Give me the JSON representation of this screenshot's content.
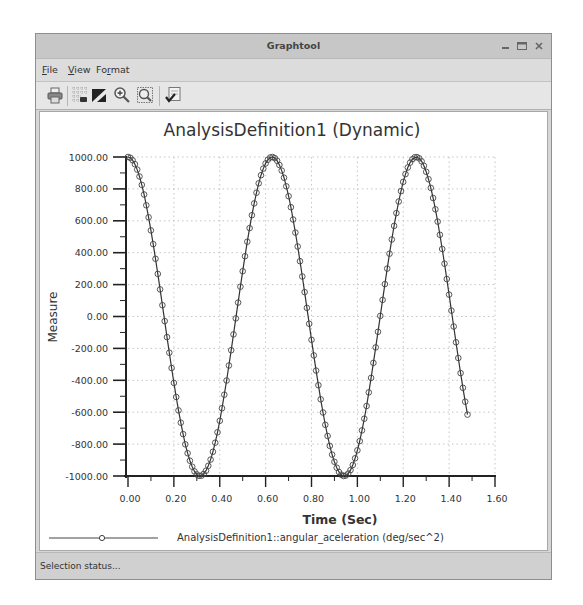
{
  "window": {
    "title": "Graphtool",
    "controls": {
      "minimize": "–",
      "maximize": "□",
      "close": "x"
    }
  },
  "menu": [
    {
      "pre": "",
      "key": "F",
      "post": "ile"
    },
    {
      "pre": "",
      "key": "V",
      "post": "iew"
    },
    {
      "pre": "Fo",
      "key": "r",
      "post": "mat"
    }
  ],
  "toolbar": {
    "icons": [
      "print-icon",
      "grid-toggle-icon",
      "color-fill-icon",
      "zoom-in-icon",
      "zoom-fit-icon",
      "edit-properties-icon"
    ]
  },
  "status": {
    "text": "Selection status..."
  },
  "colors": {
    "line": "#333333",
    "marker": "#444444",
    "grid": "#b8b8b8",
    "axis": "#222222"
  },
  "chart_data": {
    "type": "line",
    "title": "AnalysisDefinition1 (Dynamic)",
    "xlabel": "Time (Sec)",
    "ylabel": "Measure",
    "xlim": [
      0,
      1.6
    ],
    "ylim": [
      -1000,
      1000
    ],
    "grid": true,
    "legend_position": "bottom",
    "xticks": [
      "0.00",
      "0.20",
      "0.40",
      "0.60",
      "0.80",
      "1.00",
      "1.20",
      "1.40",
      "1.60"
    ],
    "yticks": [
      "1000.00",
      "800.00",
      "600.00",
      "400.00",
      "200.00",
      "0.00",
      "-200.00",
      "-400.00",
      "-600.00",
      "-800.00",
      "-1000.00"
    ],
    "x": [
      0,
      0.01,
      0.02,
      0.03,
      0.04,
      0.05,
      0.06,
      0.07,
      0.08,
      0.09,
      0.1,
      0.11,
      0.12,
      0.13,
      0.14,
      0.15,
      0.16,
      0.17,
      0.18,
      0.19,
      0.2,
      0.21,
      0.22,
      0.23,
      0.24,
      0.25,
      0.26,
      0.27,
      0.28,
      0.29,
      0.3,
      0.31,
      0.32,
      0.33,
      0.34,
      0.35,
      0.36,
      0.37,
      0.38,
      0.39,
      0.4,
      0.41,
      0.42,
      0.43,
      0.44,
      0.45,
      0.46,
      0.47,
      0.48,
      0.49,
      0.5,
      0.51,
      0.52,
      0.53,
      0.54,
      0.55,
      0.56,
      0.57,
      0.58,
      0.59,
      0.6,
      0.61,
      0.62,
      0.63,
      0.64,
      0.65,
      0.66,
      0.67,
      0.68,
      0.69,
      0.7,
      0.71,
      0.72,
      0.73,
      0.74,
      0.75,
      0.76,
      0.77,
      0.78,
      0.79,
      0.8,
      0.81,
      0.82,
      0.83,
      0.84,
      0.85,
      0.86,
      0.87,
      0.88,
      0.89,
      0.9,
      0.91,
      0.92,
      0.93,
      0.94,
      0.95,
      0.96,
      0.97,
      0.98,
      0.99,
      1.0,
      1.01,
      1.02,
      1.03,
      1.04,
      1.05,
      1.06,
      1.07,
      1.08,
      1.09,
      1.1,
      1.11,
      1.12,
      1.13,
      1.14,
      1.15,
      1.16,
      1.17,
      1.18,
      1.19,
      1.2,
      1.21,
      1.22,
      1.23,
      1.24,
      1.25,
      1.26,
      1.27,
      1.28,
      1.29,
      1.3,
      1.31,
      1.32,
      1.33,
      1.34,
      1.35,
      1.36,
      1.37,
      1.38,
      1.39,
      1.4,
      1.41,
      1.42,
      1.43,
      1.44,
      1.45,
      1.46,
      1.47,
      1.48
    ],
    "series": [
      {
        "name": "AnalysisDefinition1::angular_aceleration (deg/sec^2)",
        "values": [
          1000,
          995,
          980,
          955,
          921,
          878,
          825,
          765,
          697,
          622,
          540,
          454,
          362,
          267,
          170,
          71,
          -29,
          -129,
          -227,
          -323,
          -416,
          -505,
          -589,
          -666,
          -737,
          -801,
          -857,
          -904,
          -942,
          -971,
          -990,
          -999,
          -998,
          -987,
          -967,
          -936,
          -897,
          -848,
          -791,
          -726,
          -654,
          -575,
          -490,
          -401,
          -307,
          -211,
          -112,
          -12,
          87,
          187,
          284,
          378,
          469,
          554,
          635,
          709,
          776,
          835,
          886,
          927,
          960,
          983,
          997,
          1000,
          993,
          977,
          950,
          915,
          870,
          816,
          754,
          685,
          608,
          526,
          439,
          347,
          251,
          153,
          54,
          -46,
          -146,
          -244,
          -339,
          -431,
          -519,
          -602,
          -679,
          -749,
          -811,
          -866,
          -911,
          -948,
          -975,
          -992,
          -1000,
          -997,
          -985,
          -963,
          -931,
          -889,
          -839,
          -781,
          -714,
          -641,
          -561,
          -476,
          -385,
          -291,
          -194,
          -96,
          4,
          104,
          203,
          300,
          394,
          483,
          568,
          648,
          721,
          786,
          844,
          893,
          934,
          965,
          986,
          998,
          999,
          991,
          973,
          945,
          907,
          861,
          806,
          743,
          672,
          595,
          512,
          423,
          331,
          235,
          137,
          37,
          -63,
          -162,
          -260,
          -355,
          -447,
          -534,
          -615
        ]
      }
    ]
  }
}
